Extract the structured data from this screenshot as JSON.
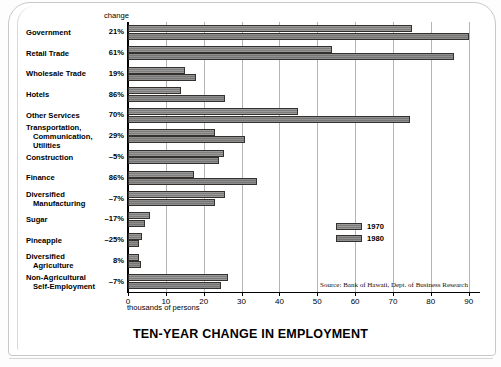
{
  "document": {
    "title": "TEN-YEAR CHANGE IN EMPLOYMENT",
    "top_edge_text": "",
    "source_note": "Source: Bank of Hawaii, Dept. of Business Research",
    "change_column_header": "change",
    "axis_caption": "thousands of persons"
  },
  "legend": {
    "position": "inside-right",
    "entries": [
      {
        "label": "1970",
        "swatch": "gray-hatched"
      },
      {
        "label": "1980",
        "swatch": "gray-solid"
      }
    ]
  },
  "chart_data": {
    "type": "bar",
    "orientation": "horizontal",
    "title": "TEN-YEAR CHANGE IN EMPLOYMENT",
    "xlabel": "thousands of persons",
    "ylabel": "",
    "xlim": [
      0,
      93
    ],
    "xticks": [
      0,
      10,
      20,
      30,
      40,
      50,
      60,
      70,
      80,
      90
    ],
    "grid": true,
    "grid_axis": "x",
    "legend_position": "inside-right",
    "categories": [
      "Government",
      "Retail Trade",
      "Wholesale Trade",
      "Hotels",
      "Other Services",
      "Transportation, Communication, Utilities",
      "Construction",
      "Finance",
      "Diversified Manufacturing",
      "Sugar",
      "Pineapple",
      "Diversified Agriculture",
      "Non-Agricultural Self-Employment"
    ],
    "category_lines": [
      [
        "Government"
      ],
      [
        "Retail Trade"
      ],
      [
        "Wholesale Trade"
      ],
      [
        "Hotels"
      ],
      [
        "Other Services"
      ],
      [
        "Transportation,",
        "Communication,",
        "Utilities"
      ],
      [
        "Construction"
      ],
      [
        "Finance"
      ],
      [
        "Diversified",
        "Manufacturing"
      ],
      [
        "Sugar"
      ],
      [
        "Pineapple"
      ],
      [
        "Diversified",
        "Agriculture"
      ],
      [
        "Non-Agricultural",
        "Self-Employment"
      ]
    ],
    "series": [
      {
        "name": "1970",
        "values": [
          75.0,
          54.0,
          15.0,
          14.0,
          45.0,
          23.0,
          25.3,
          17.5,
          25.5,
          5.8,
          3.6,
          3.0,
          26.5
        ]
      },
      {
        "name": "1980",
        "values": [
          90.0,
          86.0,
          18.0,
          25.5,
          74.5,
          31.0,
          24.0,
          34.0,
          23.0,
          4.5,
          2.8,
          3.5,
          24.5
        ]
      }
    ],
    "change_labels": [
      "21%",
      "61%",
      "19%",
      "86%",
      "70%",
      "29%",
      "-5%",
      "86%",
      "-7%",
      "-17%",
      "-25%",
      "8%",
      "-7%"
    ]
  }
}
